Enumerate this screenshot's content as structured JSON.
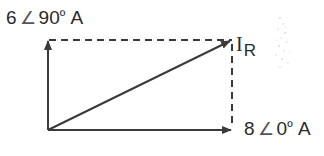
{
  "diagram": {
    "type": "phasor-diagram",
    "colors": {
      "line": "#3a3a3a",
      "dashed": "#3a3a3a",
      "text": "#2a2a2a",
      "background": "#ffffff"
    },
    "phasors": [
      {
        "name": "vertical-phasor",
        "magnitude": "6",
        "angle_symbol": "∠",
        "angle": "90",
        "degree_symbol": "º",
        "unit": "A"
      },
      {
        "name": "horizontal-phasor",
        "magnitude": "8",
        "angle_symbol": "∠",
        "angle": "0",
        "degree_symbol": "º",
        "unit": "A"
      }
    ],
    "resultant": {
      "symbol": "I",
      "subscript": "R"
    }
  }
}
